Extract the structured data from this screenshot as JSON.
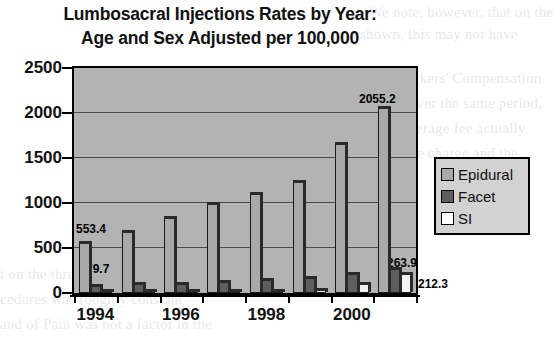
{
  "chart_data": {
    "type": "bar",
    "title": "Lumbosacral Injections Rates by Year: Age and Sex Adjusted per 100,000",
    "title_lines": [
      "Lumbosacral Injections Rates by Year:",
      "Age and Sex Adjusted per 100,000"
    ],
    "xlabel": "",
    "ylabel": "",
    "ylim": [
      0,
      2500
    ],
    "yticks": [
      0,
      500,
      1000,
      1500,
      2000,
      2500
    ],
    "ytick_labels": [
      "0",
      "500",
      "1000",
      "1500",
      "2000",
      "2500"
    ],
    "grid": true,
    "legend_position": "right",
    "categories": [
      "1994",
      "1995",
      "1996",
      "1997",
      "1998",
      "1999",
      "2000",
      "2001"
    ],
    "xtick_labels_shown": [
      "1994",
      "",
      "1996",
      "",
      "1998",
      "",
      "2000",
      ""
    ],
    "series": [
      {
        "name": "Epidural",
        "color": "#a9a9a9",
        "values": [
          553.4,
          680,
          830,
          990,
          1100,
          1230,
          1660,
          2055.2
        ]
      },
      {
        "name": "Facet",
        "color": "#5e5e5e",
        "values": [
          79.7,
          95,
          105,
          120,
          140,
          165,
          215,
          263.9
        ]
      },
      {
        "name": "SI",
        "color": "#f2f2f2",
        "values": [
          8,
          10,
          14,
          18,
          24,
          36,
          95,
          212.3
        ]
      }
    ],
    "annotations": [
      {
        "text": "553.4",
        "series": "Epidural",
        "category": "1994",
        "value": 553.4
      },
      {
        "text": "79.7",
        "series": "Facet",
        "category": "1994",
        "value": 79.7
      },
      {
        "text": "2055.2",
        "series": "Epidural",
        "category": "2001",
        "value": 2055.2
      },
      {
        "text": "263.9",
        "series": "Facet",
        "category": "2001",
        "value": 263.9
      },
      {
        "text": "212.3",
        "series": "SI",
        "category": "2001",
        "value": 212.3
      }
    ],
    "plot_background": "#b3b3b3"
  },
  "legend": {
    "items": [
      {
        "label": "Epidural",
        "swatch": "epidural"
      },
      {
        "label": "Facet",
        "swatch": "facet"
      },
      {
        "label": "SI",
        "swatch": "si"
      }
    ]
  },
  "background_text": {
    "lines": [
      "et. We note, however, that on the",
      "shown, this may not have",
      "to the Workers' Compensation",
      "of 2000. Over the same period,",
      "ent, the average fee actually",
      "e-of-service charge and the",
      "t on the three most common",
      "cedures was roughly constant",
      "and of Pain was not a factor in the"
    ]
  }
}
